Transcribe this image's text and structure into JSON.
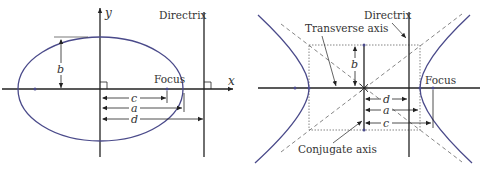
{
  "figure": {
    "panels": [
      {
        "id": "ellipse",
        "title": "Ellipse",
        "labels": {
          "x_axis": "x",
          "y_axis": "y",
          "directrix": "Directrix",
          "focus": "Focus",
          "b": "b",
          "c": "c",
          "a": "a",
          "d": "d"
        }
      },
      {
        "id": "hyperbola",
        "title": "Hyperbola",
        "labels": {
          "directrix": "Directrix",
          "transverse_axis": "Transverse axis",
          "conjugate_axis": "Conjugate axis",
          "focus": "Focus",
          "b": "b",
          "d": "d",
          "a": "a",
          "c": "c"
        }
      }
    ],
    "colors": {
      "curve": "#4a4a8a",
      "axes": "#222222",
      "guides": "#555555",
      "text": "#333333"
    }
  }
}
